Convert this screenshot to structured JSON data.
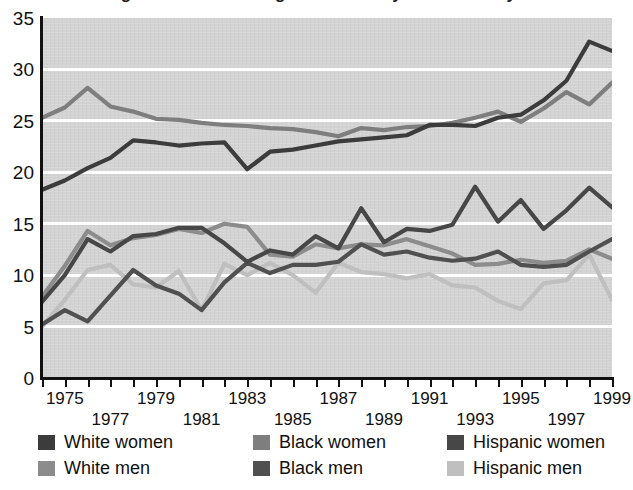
{
  "title": "Percentage of bachelor's degree holders by race/ethnicity and sex",
  "chart_data": {
    "type": "line",
    "title": "Percentage of bachelor's degree holders by race/ethnicity and sex",
    "xlabel": "",
    "ylabel": "",
    "xlim": [
      1974,
      1999
    ],
    "ylim": [
      0,
      35
    ],
    "ytick_values": [
      0,
      5,
      10,
      15,
      20,
      25,
      30,
      35
    ],
    "ytick_labels": [
      "0",
      "5",
      "10",
      "15",
      "20",
      "25",
      "30",
      "35"
    ],
    "grid": "horizontal-white",
    "legend_position": "below",
    "x": [
      1974,
      1975,
      1976,
      1977,
      1978,
      1979,
      1980,
      1981,
      1982,
      1983,
      1984,
      1985,
      1986,
      1987,
      1988,
      1989,
      1990,
      1991,
      1992,
      1993,
      1994,
      1995,
      1996,
      1997,
      1998,
      1999
    ],
    "xtick_labels_row1": [
      "1975",
      "1979",
      "1983",
      "1987",
      "1991",
      "1995",
      "1999"
    ],
    "xtick_labels_row2": [
      "1977",
      "1981",
      "1985",
      "1989",
      "1993",
      "1997"
    ],
    "series": [
      {
        "name": "White women",
        "color": "#3c3c3c",
        "values": [
          18.3,
          19.2,
          20.4,
          21.4,
          23.1,
          22.9,
          22.6,
          22.8,
          22.9,
          20.3,
          22.0,
          22.2,
          22.6,
          23.0,
          23.2,
          23.4,
          23.6,
          24.6,
          24.6,
          24.5,
          25.3,
          25.6,
          27.0,
          28.9,
          32.7,
          31.8
        ]
      },
      {
        "name": "White men",
        "color": "#8c8c8c",
        "values": [
          7.9,
          10.9,
          14.3,
          12.9,
          13.6,
          13.9,
          14.5,
          14.1,
          15.0,
          14.7,
          12.0,
          11.8,
          13.0,
          12.6,
          13.0,
          12.9,
          13.5,
          12.8,
          12.1,
          11.0,
          11.1,
          11.5,
          11.2,
          11.4,
          12.5,
          11.6
        ]
      },
      {
        "name": "Black women",
        "color": "#7e7e7e",
        "values": [
          25.3,
          26.3,
          28.2,
          26.4,
          25.9,
          25.2,
          25.1,
          24.8,
          24.6,
          24.5,
          24.3,
          24.2,
          23.9,
          23.5,
          24.3,
          24.1,
          24.4,
          24.5,
          24.8,
          25.3,
          25.9,
          24.9,
          26.2,
          27.8,
          26.6,
          28.7
        ]
      },
      {
        "name": "Black men",
        "color": "#505050",
        "values": [
          5.2,
          6.6,
          5.5,
          8.0,
          10.5,
          9.0,
          8.2,
          6.6,
          9.3,
          11.2,
          10.2,
          11.0,
          11.0,
          11.3,
          13.0,
          12.0,
          12.3,
          11.7,
          11.4,
          11.6,
          12.3,
          11.0,
          10.8,
          11.0,
          12.3,
          13.5
        ]
      },
      {
        "name": "Hispanic women",
        "color": "#474747",
        "values": [
          7.4,
          10.0,
          13.5,
          12.3,
          13.8,
          14.0,
          14.6,
          14.6,
          13.1,
          11.3,
          12.4,
          12.0,
          13.8,
          12.6,
          16.5,
          13.2,
          14.5,
          14.3,
          14.9,
          18.6,
          15.2,
          17.3,
          14.5,
          16.3,
          18.5,
          16.6
        ]
      },
      {
        "name": "Hispanic men",
        "color": "#bfbfbf",
        "values": [
          5.0,
          7.6,
          10.5,
          11.0,
          9.1,
          8.8,
          10.4,
          6.6,
          11.1,
          10.0,
          11.2,
          10.0,
          8.3,
          11.2,
          10.3,
          10.1,
          9.7,
          10.1,
          9.0,
          8.8,
          7.5,
          6.7,
          9.2,
          9.5,
          12.0,
          7.6
        ]
      }
    ]
  },
  "legend": {
    "columns": [
      {
        "items": [
          {
            "label": "White women",
            "color": "#3c3c3c",
            "swatch_name": "swatch-white-women"
          },
          {
            "label": "White men",
            "color": "#8c8c8c",
            "swatch_name": "swatch-white-men"
          }
        ]
      },
      {
        "items": [
          {
            "label": "Black women",
            "color": "#7e7e7e",
            "swatch_name": "swatch-black-women"
          },
          {
            "label": "Black men",
            "color": "#505050",
            "swatch_name": "swatch-black-men"
          }
        ]
      },
      {
        "items": [
          {
            "label": "Hispanic women",
            "color": "#474747",
            "swatch_name": "swatch-hispanic-women"
          },
          {
            "label": "Hispanic men",
            "color": "#bfbfbf",
            "swatch_name": "swatch-hispanic-men"
          }
        ]
      }
    ]
  }
}
